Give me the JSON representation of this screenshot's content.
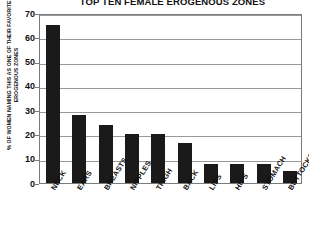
{
  "chart_data": {
    "type": "bar",
    "title": "TOP TEN FEMALE EROGENOUS ZONES",
    "xlabel": "",
    "ylabel": "% OF WOMEN NAMING THIS AS ONE OF THEIR FAVORITE EROGENOUS ZONES",
    "ylim": [
      0,
      70
    ],
    "yticks": [
      0,
      10,
      20,
      30,
      40,
      50,
      60,
      70
    ],
    "ytick_labels": [
      "0",
      "10",
      "20",
      "30",
      "40",
      "50",
      "60",
      "70"
    ],
    "grid": true,
    "legend": false,
    "bar_color": "#1a1a1a",
    "categories": [
      "NECK",
      "EARS",
      "BREASTS",
      "NIPPLES",
      "THIGH",
      "BACK",
      "LIPS",
      "HIPS",
      "STOMACH",
      "BUTTOCKS"
    ],
    "values": [
      65,
      28,
      24,
      20,
      20,
      16.5,
      8,
      8,
      8,
      5
    ],
    "series": [
      {
        "name": "% of women naming this as one of their favorite erogenous zones",
        "values": [
          65,
          28,
          24,
          20,
          20,
          16.5,
          8,
          8,
          8,
          5
        ]
      }
    ]
  }
}
